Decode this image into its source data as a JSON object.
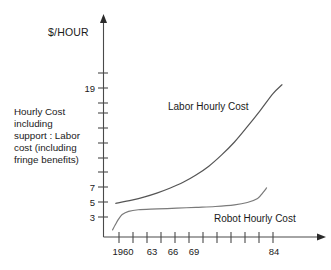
{
  "chart_data": {
    "type": "line",
    "title": "$/HOUR",
    "xlabel": "",
    "ylabel": "$/HOUR",
    "grid": false,
    "legend_position": "inline-annotations",
    "xlim": [
      1958.5,
      1986
    ],
    "ylim": [
      0,
      26
    ],
    "x_tick_labels": [
      "1960",
      "63",
      "66",
      "69",
      "84"
    ],
    "x_tick_values": [
      1960,
      1963,
      1966,
      1969,
      1984
    ],
    "x_all_tick_values": [
      1960,
      1962,
      1964,
      1966,
      1968,
      1970,
      1972,
      1974,
      1976,
      1978,
      1980,
      1982,
      1984
    ],
    "y_tick_labels": [
      "19",
      "7",
      "5",
      "3"
    ],
    "y_tick_values": [
      19,
      7,
      5,
      3
    ],
    "y_all_tick_values": [
      3,
      5,
      7,
      9,
      11,
      13,
      15,
      17,
      19,
      21
    ],
    "series": [
      {
        "name": "Labor Hourly Cost",
        "color": "#555555",
        "x": [
          1959.5,
          1962,
          1964,
          1966,
          1968,
          1970,
          1972,
          1974,
          1976,
          1978,
          1980,
          1982,
          1984,
          1985.4
        ],
        "values": [
          4.7,
          5.1,
          5.5,
          6.0,
          6.6,
          7.3,
          8.2,
          9.3,
          10.7,
          12.3,
          14.2,
          16.2,
          18.3,
          19.4
        ]
      },
      {
        "name": "Robot Hourly Cost",
        "color": "#7a7a7a",
        "x": [
          1959.0,
          1959.4,
          1959.9,
          1960.5,
          1961.5,
          1963,
          1966,
          1969,
          1972,
          1975,
          1978,
          1980,
          1981.6,
          1982.4,
          1983.0
        ],
        "values": [
          1.4,
          2.0,
          2.7,
          3.3,
          3.7,
          3.9,
          4.0,
          4.1,
          4.2,
          4.3,
          4.5,
          4.8,
          5.3,
          6.0,
          6.6
        ]
      }
    ],
    "annotations": [
      {
        "name": "labor-series-label",
        "text": "Labor Hourly Cost"
      },
      {
        "name": "robot-series-label",
        "text": "Robot Hourly Cost"
      }
    ]
  },
  "description": {
    "lines": [
      "Hourly Cost",
      "including",
      "support : Labor",
      "cost (including",
      "fringe benefits)"
    ]
  },
  "colors": {
    "axis": "#4a4a4a",
    "labor_curve": "#555555",
    "robot_curve": "#7a7a7a",
    "text": "#1a1a1a",
    "background": "#ffffff"
  }
}
